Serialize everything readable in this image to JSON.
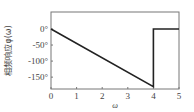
{
  "chart_data": {
    "type": "line",
    "title": "",
    "xlabel": "ω",
    "ylabel": "相频响应φ(ω)",
    "xlim": [
      0,
      5
    ],
    "ylim": [
      -187,
      53
    ],
    "grid": false,
    "legend": null,
    "x_ticks": [
      0,
      1,
      2,
      3,
      4,
      5
    ],
    "x_tick_labels": [
      "0",
      "1",
      "2",
      "3",
      "4",
      "5"
    ],
    "y_ticks": [
      0,
      -50,
      -100,
      -150
    ],
    "y_tick_labels": [
      "0°",
      "-50°",
      "-100°",
      "-150°"
    ],
    "series": [
      {
        "name": "phase response",
        "color": "#222222",
        "points": [
          {
            "x": 0,
            "y": 0
          },
          {
            "x": 4,
            "y": -180
          },
          {
            "x": 4,
            "y": 0
          },
          {
            "x": 5,
            "y": 0
          }
        ]
      }
    ]
  },
  "layout": {
    "plot": {
      "left": 51,
      "top": 12,
      "right": 179,
      "bottom": 89
    }
  }
}
